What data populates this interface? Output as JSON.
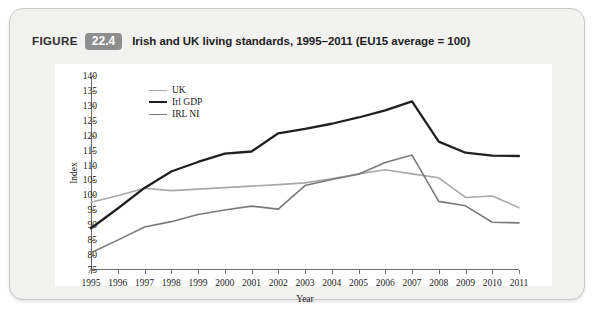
{
  "figure": {
    "word": "FIGURE",
    "number": "22.4",
    "caption": "Irish and UK living standards, 1995–2011 (EU15 average  = 100)"
  },
  "chart_data": {
    "type": "line",
    "title": "Irish and UK living standards, 1995–2011 (EU15 average  = 100)",
    "xlabel": "Year",
    "ylabel": "Index",
    "xlim": [
      1995,
      2011
    ],
    "ylim": [
      75,
      140
    ],
    "ytick_step": 5,
    "grid": false,
    "legend_position": "top-left",
    "categories": [
      "1995",
      "1996",
      "1997",
      "1998",
      "1999",
      "2000",
      "2001",
      "2002",
      "2003",
      "2004",
      "2005",
      "2006",
      "2007",
      "2008",
      "2009",
      "2010",
      "2011"
    ],
    "yticks": [
      "75",
      "80",
      "85",
      "90",
      "95",
      "100",
      "105",
      "110",
      "115",
      "120",
      "125",
      "130",
      "135",
      "140"
    ],
    "series": [
      {
        "name": "UK",
        "color": "#a8a8a8",
        "width": 1.6,
        "values": [
          97.7,
          99.9,
          102.4,
          101.6,
          102.1,
          102.6,
          103.1,
          103.6,
          104.2,
          105.6,
          107.2,
          108.6,
          107.2,
          105.9,
          99.3,
          99.8,
          95.9
        ]
      },
      {
        "name": "Irl GDP",
        "color": "#231f20",
        "width": 2.3,
        "values": [
          89.0,
          95.6,
          102.5,
          108.0,
          111.2,
          114.0,
          114.7,
          120.8,
          122.3,
          124.0,
          126.1,
          128.5,
          131.5,
          118.0,
          114.3,
          113.3,
          113.2
        ]
      },
      {
        "name": "IRL NI",
        "color": "#7a7a7a",
        "width": 1.6,
        "values": [
          80.8,
          85.0,
          89.4,
          91.2,
          93.6,
          95.1,
          96.4,
          95.4,
          103.3,
          105.3,
          107.1,
          111.0,
          113.5,
          98.0,
          96.5,
          91.0,
          90.8
        ]
      }
    ]
  }
}
